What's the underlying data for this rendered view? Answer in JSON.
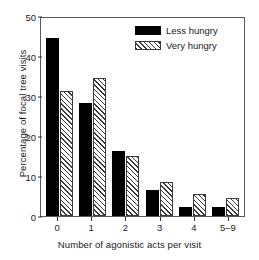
{
  "chart_data": {
    "type": "bar",
    "title": "",
    "xlabel": "Number of agonistic acts per visit",
    "ylabel": "Percentage of focal tree visits",
    "categories": [
      "0",
      "1",
      "2",
      "3",
      "4",
      "5–9"
    ],
    "series": [
      {
        "name": "Less hungry",
        "values": [
          44.6,
          28.3,
          16.2,
          6.5,
          2.2,
          2.2
        ],
        "fill": "solid",
        "color": "#000000"
      },
      {
        "name": "Very hungry",
        "values": [
          31.3,
          34.5,
          15.0,
          8.5,
          5.5,
          4.5
        ],
        "fill": "hatch",
        "color": "#3a3a3a"
      }
    ],
    "ylim": [
      0,
      50
    ],
    "yticks": [
      0,
      10,
      20,
      30,
      40,
      50
    ],
    "ytick_labels": [
      "0",
      "10",
      "20",
      "30",
      "40",
      "50"
    ],
    "grid": false,
    "legend_position": "top-right",
    "frame": "box"
  },
  "legend": {
    "items": [
      {
        "label": "Less hungry"
      },
      {
        "label": "Very hungry"
      }
    ]
  },
  "axes": {
    "y_title": "Percentage of focal tree visits",
    "x_title": "Number of agonistic acts per visit"
  }
}
